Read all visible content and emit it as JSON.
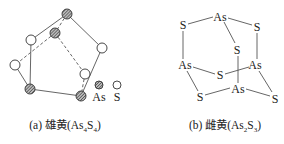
{
  "figure_a": {
    "caption_prefix": "(a) 雄黄(As",
    "caption_sub1": "4",
    "caption_mid": "S",
    "caption_sub2": "4",
    "caption_suffix": ")",
    "legend": {
      "as_label": "As",
      "s_label": "S"
    },
    "atoms": [
      {
        "id": "as-top",
        "type": "As",
        "x": 67,
        "y": 14
      },
      {
        "id": "as-inner",
        "type": "As",
        "x": 55,
        "y": 33
      },
      {
        "id": "as-bottom-left",
        "type": "As",
        "x": 30,
        "y": 89
      },
      {
        "id": "as-bottom-right",
        "type": "As",
        "x": 81,
        "y": 96
      },
      {
        "id": "s-left-upper",
        "type": "S",
        "x": 31,
        "y": 40
      },
      {
        "id": "s-right",
        "type": "S",
        "x": 102,
        "y": 48
      },
      {
        "id": "s-far-left",
        "type": "S",
        "x": 15,
        "y": 65
      },
      {
        "id": "s-inner-right",
        "type": "S",
        "x": 85,
        "y": 74
      }
    ]
  },
  "figure_b": {
    "caption_prefix": "(b) 雌黄(As",
    "caption_sub1": "2",
    "caption_mid": "S",
    "caption_sub2": "3",
    "caption_suffix": ")",
    "labels": {
      "as_top": "As",
      "s_top_left": "S",
      "s_top_right": "S",
      "s_middle": "S",
      "as_left": "As",
      "as_right": "As",
      "s_center": "S",
      "as_bottom": "As",
      "s_bottom_left": "S",
      "s_bottom_right": "S"
    }
  }
}
